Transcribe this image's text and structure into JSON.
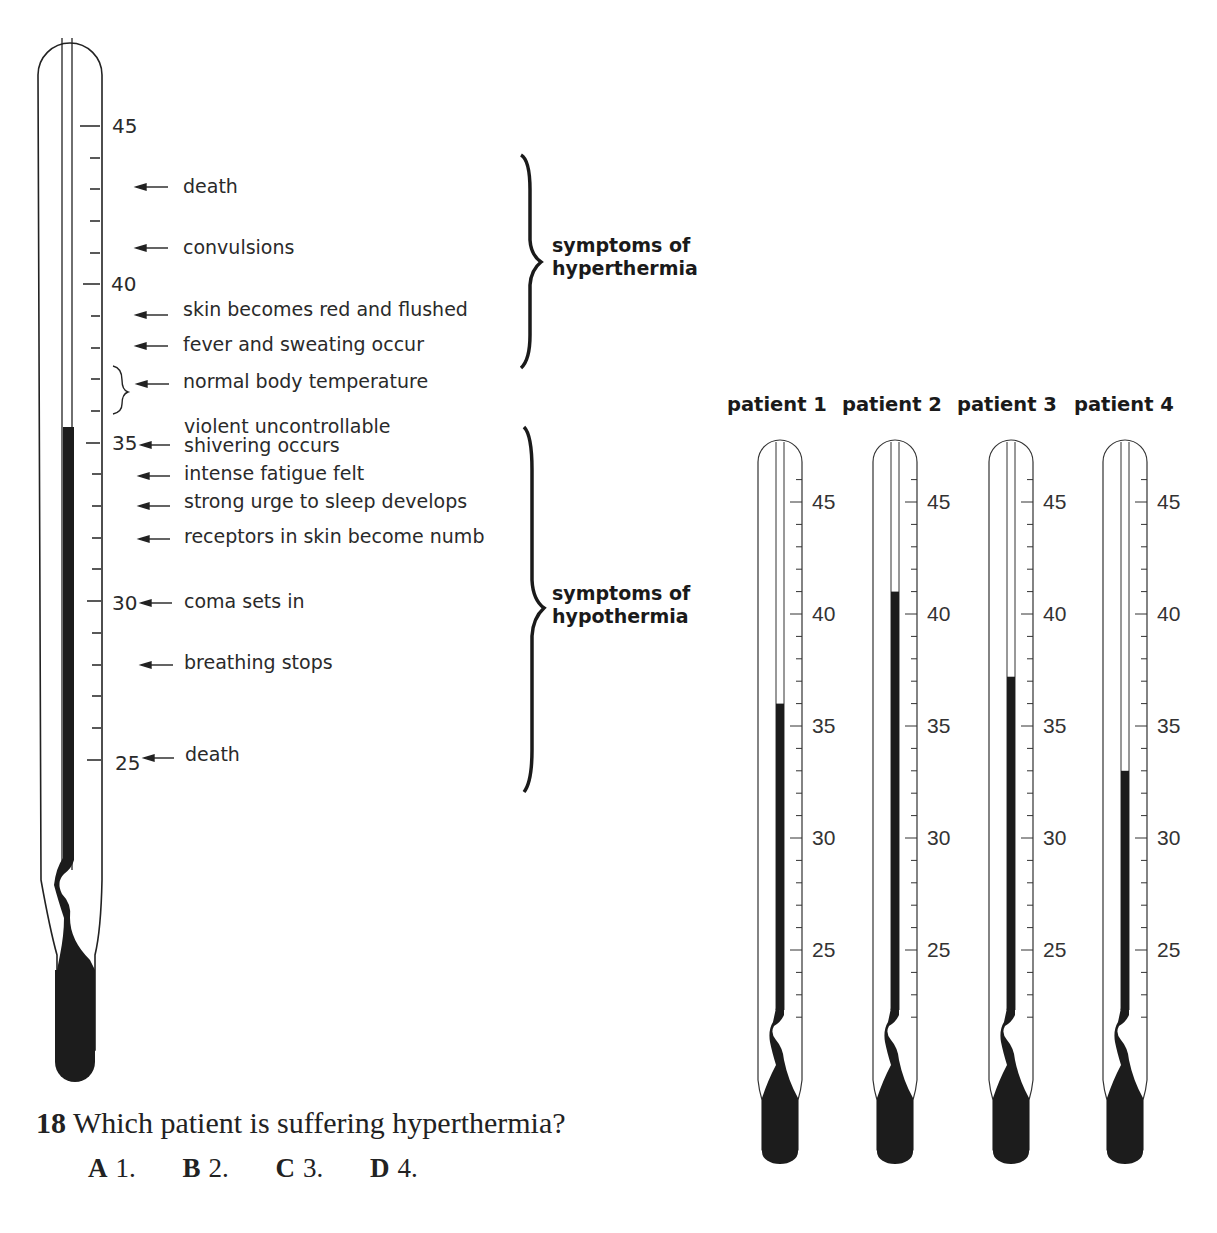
{
  "reference_thermometer": {
    "scale_labels": [
      "45",
      "40",
      "35",
      "30",
      "25"
    ],
    "reading_celsius": 35.5,
    "symptoms": [
      {
        "temp": 43,
        "text": "death"
      },
      {
        "temp": 41,
        "text": "convulsions"
      },
      {
        "temp": 39,
        "text": "skin becomes red and flushed"
      },
      {
        "temp": 38,
        "text": "fever and sweating occur"
      },
      {
        "temp": 37,
        "text": "normal body temperature"
      },
      {
        "temp": 35,
        "text_line1": "violent uncontrollable",
        "text_line2": "shivering occurs"
      },
      {
        "temp": 34,
        "text": "intense fatigue felt"
      },
      {
        "temp": 33,
        "text": "strong urge to sleep develops"
      },
      {
        "temp": 32,
        "text": "receptors in skin become numb"
      },
      {
        "temp": 30,
        "text": "coma sets in"
      },
      {
        "temp": 28,
        "text": "breathing stops"
      },
      {
        "temp": 25,
        "text": "death"
      }
    ],
    "groups": {
      "hyperthermia_line1": "symptoms of",
      "hyperthermia_line2": "hyperthermia",
      "hypothermia_line1": "symptoms of",
      "hypothermia_line2": "hypothermia"
    }
  },
  "patients": [
    {
      "title": "patient 1",
      "reading_celsius": 36
    },
    {
      "title": "patient 2",
      "reading_celsius": 41
    },
    {
      "title": "patient 3",
      "reading_celsius": 37.2
    },
    {
      "title": "patient 4",
      "reading_celsius": 33
    }
  ],
  "patient_scale_labels": [
    "45",
    "40",
    "35",
    "30",
    "25"
  ],
  "question": {
    "number": "18",
    "text": "Which patient is suffering hyperthermia?",
    "options": [
      {
        "letter": "A",
        "text": "1."
      },
      {
        "letter": "B",
        "text": "2."
      },
      {
        "letter": "C",
        "text": "3."
      },
      {
        "letter": "D",
        "text": "4."
      }
    ]
  },
  "chart_data": {
    "type": "bar",
    "categories": [
      "patient 1",
      "patient 2",
      "patient 3",
      "patient 4"
    ],
    "values": [
      36,
      41,
      37.2,
      33
    ],
    "ylabel": "Temperature (°C)",
    "ylim": [
      22,
      47
    ],
    "tick_labels": [
      25,
      30,
      35,
      40,
      45
    ]
  }
}
